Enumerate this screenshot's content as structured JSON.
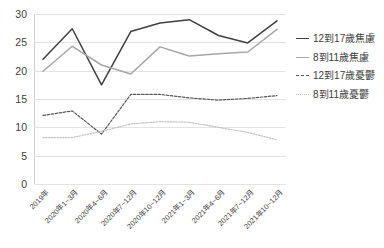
{
  "chart_data": {
    "type": "line",
    "title": "",
    "xlabel": "",
    "ylabel": "",
    "ylim": [
      0,
      30
    ],
    "yticks": [
      0,
      5,
      10,
      15,
      20,
      25,
      30
    ],
    "grid": true,
    "legend_position": "right",
    "categories": [
      "2019年",
      "2020年1~3月",
      "2020年4~6月",
      "2020年7~12月",
      "2020年10~12月",
      "2021年1~3月",
      "2021年4~6月",
      "2021年7~12月",
      "2021年10~12月"
    ],
    "series": [
      {
        "name": "12到17歲焦慮",
        "color": "#404040",
        "style": "solid",
        "values": [
          22.0,
          27.4,
          17.5,
          26.9,
          28.4,
          29.0,
          26.2,
          24.9,
          28.8
        ]
      },
      {
        "name": "8到11歲焦慮",
        "color": "#a6a6a6",
        "style": "solid",
        "values": [
          19.9,
          24.3,
          21.0,
          19.4,
          24.2,
          22.6,
          23.0,
          23.3,
          27.3
        ]
      },
      {
        "name": "12到17歲憂鬱",
        "color": "#595959",
        "style": "dashed",
        "values": [
          12.1,
          12.9,
          8.8,
          15.8,
          15.8,
          15.2,
          14.8,
          15.1,
          15.6
        ]
      },
      {
        "name": "8到11歲憂鬱",
        "color": "#c2c2c2",
        "style": "dotted",
        "values": [
          8.2,
          8.2,
          9.3,
          10.6,
          11.0,
          10.9,
          10.0,
          9.1,
          7.8
        ]
      }
    ]
  },
  "legend": {
    "items": [
      {
        "label": "12到17歲焦慮",
        "swatch": "sw-solid-dark"
      },
      {
        "label": "8到11歲焦慮",
        "swatch": "sw-solid-gray"
      },
      {
        "label": "12到17歲憂鬱",
        "swatch": "sw-dash-dark"
      },
      {
        "label": "8到11歲憂鬱",
        "swatch": "sw-dash-gray"
      }
    ]
  }
}
